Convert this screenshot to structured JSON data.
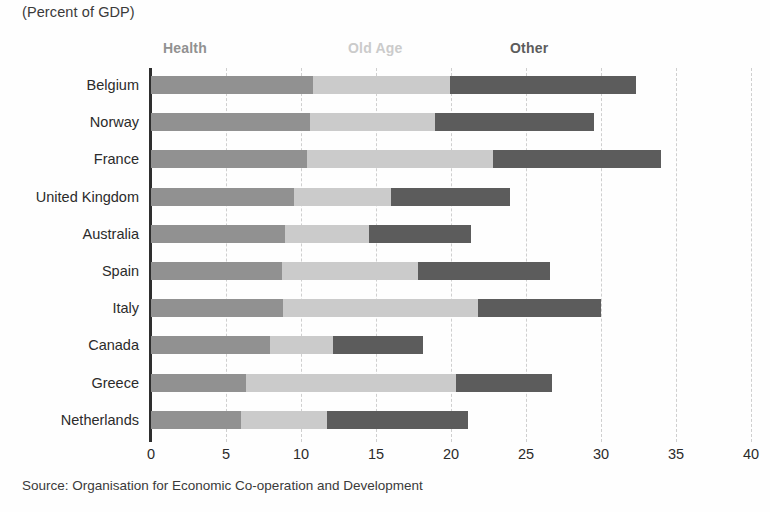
{
  "subtitle": "(Percent of GDP)",
  "source": "Source: Organisation for Economic Co-operation and Development",
  "legend": {
    "health": "Health",
    "old_age": "Old Age",
    "other": "Other"
  },
  "colors": {
    "health": "#919191",
    "old_age": "#cbcbcb",
    "other": "#5c5c5c",
    "axis": "#2e2e2e",
    "grid": "#cfcfcf",
    "text": "#2b2b2b"
  },
  "axis": {
    "ticks": [
      "0",
      "5",
      "10",
      "15",
      "20",
      "25",
      "30",
      "35",
      "40"
    ],
    "min": 0,
    "max": 40,
    "step": 5
  },
  "chart_data": {
    "type": "bar",
    "orientation": "horizontal",
    "stacked": true,
    "title": "",
    "subtitle": "(Percent of GDP)",
    "xlabel": "",
    "ylabel": "",
    "xlim": [
      0,
      40
    ],
    "xticks": [
      0,
      5,
      10,
      15,
      20,
      25,
      30,
      35,
      40
    ],
    "grid": "vertical-dashed",
    "legend_position": "top",
    "categories": [
      "Belgium",
      "Norway",
      "France",
      "United Kingdom",
      "Australia",
      "Spain",
      "Italy",
      "Canada",
      "Greece",
      "Netherlands"
    ],
    "series": [
      {
        "name": "Health",
        "color": "#919191",
        "values": [
          10.8,
          10.6,
          10.4,
          9.5,
          8.9,
          8.7,
          8.8,
          7.9,
          6.3,
          6.0
        ]
      },
      {
        "name": "Old Age",
        "color": "#cbcbcb",
        "values": [
          9.1,
          8.3,
          12.4,
          6.5,
          5.6,
          9.1,
          13.0,
          4.2,
          14.0,
          5.7
        ]
      },
      {
        "name": "Other",
        "color": "#5c5c5c",
        "values": [
          12.4,
          10.6,
          11.2,
          7.9,
          6.8,
          8.8,
          8.2,
          6.0,
          6.4,
          9.4
        ]
      }
    ],
    "totals": [
      32.3,
      29.5,
      34.0,
      23.9,
      21.3,
      26.6,
      30.0,
      18.1,
      26.7,
      21.1
    ]
  }
}
